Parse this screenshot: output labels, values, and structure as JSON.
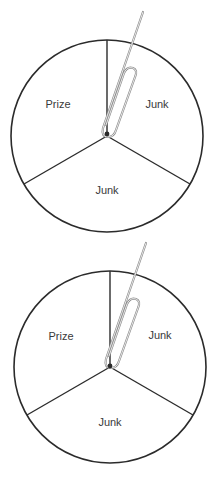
{
  "figure": {
    "colors": {
      "outline": "#2b2b2b",
      "text": "#3a3a3a",
      "paperclip": "#8a8a8a",
      "background": "#ffffff"
    },
    "spinners": [
      {
        "id": "top",
        "sectors": [
          {
            "label": "Prize"
          },
          {
            "label": "Junk"
          },
          {
            "label": "Junk"
          }
        ]
      },
      {
        "id": "bottom",
        "sectors": [
          {
            "label": "Prize"
          },
          {
            "label": "Junk"
          },
          {
            "label": "Junk"
          }
        ]
      }
    ]
  }
}
